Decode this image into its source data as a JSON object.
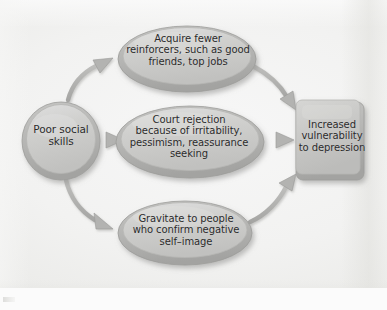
{
  "figure": {
    "type": "flow-diagram",
    "orientation": "left-to-right",
    "palette": {
      "background": "#f2f2f1",
      "shape_fill": "#c9c9c7",
      "shape_fill_light": "#d7d7d5",
      "shape_edge": "#9a9a98",
      "shape_shadow": "#a8a8a6",
      "arrow": "#b0b0ae",
      "arrow_edge": "#8f8f8d",
      "text": "#2a2a2a"
    }
  },
  "source": {
    "id": "poor-social-skills",
    "shape": "circle",
    "label": "Poor social\nskills"
  },
  "paths": [
    {
      "id": "acquire-fewer-reinforcers",
      "shape": "ellipse",
      "label": "Acquire fewer\nreinforcers, such as good\nfriends, top jobs"
    },
    {
      "id": "court-rejection",
      "shape": "ellipse",
      "label": "Court rejection\nbecause of irritability,\npessimism, reassurance\nseeking"
    },
    {
      "id": "gravitate-to-people",
      "shape": "ellipse",
      "label": "Gravitate to people\nwho confirm negative\nself–image"
    }
  ],
  "outcome": {
    "id": "increased-vulnerability",
    "shape": "rounded-rectangle",
    "label": "Increased\nvulnerability\nto depression"
  },
  "connectors": [
    {
      "id": "source-to-path-0",
      "from": "poor-social-skills",
      "to": "acquire-fewer-reinforcers",
      "style": "curved-arrow"
    },
    {
      "id": "source-to-path-1",
      "from": "poor-social-skills",
      "to": "court-rejection",
      "style": "straight-arrow"
    },
    {
      "id": "source-to-path-2",
      "from": "poor-social-skills",
      "to": "gravitate-to-people",
      "style": "curved-arrow"
    },
    {
      "id": "path-0-to-outcome",
      "from": "acquire-fewer-reinforcers",
      "to": "increased-vulnerability",
      "style": "curved-arrow"
    },
    {
      "id": "path-1-to-outcome",
      "from": "court-rejection",
      "to": "increased-vulnerability",
      "style": "straight-arrow"
    },
    {
      "id": "path-2-to-outcome",
      "from": "gravitate-to-people",
      "to": "increased-vulnerability",
      "style": "curved-arrow"
    }
  ]
}
